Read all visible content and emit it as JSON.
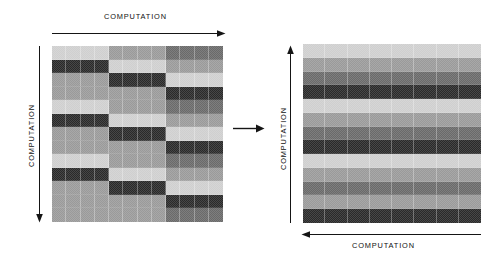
{
  "figure": {
    "title": "",
    "background_color": "#ffffff"
  },
  "labels": {
    "top_left": "COMPUTATION",
    "side_left": "COMPUTATION",
    "side_right": "COMPUTATION",
    "bottom_right": "COMPUTATION"
  },
  "arrows": {
    "top_left": {
      "name": "arrow-right",
      "direction": "right"
    },
    "side_left": {
      "name": "arrow-down",
      "direction": "down"
    },
    "middle": {
      "name": "arrow-right",
      "direction": "right"
    },
    "side_right": {
      "name": "arrow-up",
      "direction": "up"
    },
    "bottom_right": {
      "name": "arrow-left",
      "direction": "left"
    }
  },
  "chart_data": {
    "type": "heatmap",
    "title": "",
    "xlabel": "COMPUTATION",
    "ylabel": "COMPUTATION",
    "colormap": "grayscale",
    "value_range": [
      0,
      3
    ],
    "legend": [],
    "grid": true,
    "panels": [
      {
        "name": "left-matrix",
        "rows": 13,
        "cols": 12,
        "column_groups": 3,
        "columns_per_group": 4,
        "description": "Unbalanced / scattered block assignment before redistribution",
        "shade_levels": {
          "0": "#cfcfcf",
          "1": "#9a9a9a",
          "2": "#6a6a6a",
          "3": "#2a2a2a"
        },
        "values": [
          [
            0,
            0,
            0,
            0,
            1,
            1,
            1,
            1,
            2,
            2,
            2,
            2
          ],
          [
            3,
            3,
            3,
            3,
            0,
            0,
            0,
            0,
            1,
            1,
            1,
            1
          ],
          [
            1,
            1,
            1,
            1,
            3,
            3,
            3,
            3,
            0,
            0,
            0,
            0
          ],
          [
            1,
            1,
            1,
            1,
            1,
            1,
            1,
            1,
            3,
            3,
            3,
            3
          ],
          [
            0,
            0,
            0,
            0,
            1,
            1,
            1,
            1,
            2,
            2,
            2,
            2
          ],
          [
            3,
            3,
            3,
            3,
            0,
            0,
            0,
            0,
            1,
            1,
            1,
            1
          ],
          [
            1,
            1,
            1,
            1,
            3,
            3,
            3,
            3,
            0,
            0,
            0,
            0
          ],
          [
            1,
            1,
            1,
            1,
            1,
            1,
            1,
            1,
            3,
            3,
            3,
            3
          ],
          [
            0,
            0,
            0,
            0,
            1,
            1,
            1,
            1,
            2,
            2,
            2,
            2
          ],
          [
            3,
            3,
            3,
            3,
            0,
            0,
            0,
            0,
            1,
            1,
            1,
            1
          ],
          [
            1,
            1,
            1,
            1,
            3,
            3,
            3,
            3,
            0,
            0,
            0,
            0
          ],
          [
            1,
            1,
            1,
            1,
            1,
            1,
            1,
            1,
            3,
            3,
            3,
            3
          ],
          [
            1,
            1,
            1,
            1,
            1,
            1,
            1,
            1,
            2,
            2,
            2,
            2
          ]
        ]
      },
      {
        "name": "right-matrix",
        "rows": 13,
        "cols": 8,
        "column_groups": 8,
        "columns_per_group": 1,
        "description": "Balanced / striped assignment after redistribution — each row uniform across all columns",
        "shade_levels": {
          "0": "#cfcfcf",
          "1": "#9a9a9a",
          "2": "#6a6a6a",
          "3": "#2a2a2a"
        },
        "values": [
          [
            0,
            0,
            0,
            0,
            0,
            0,
            0,
            0
          ],
          [
            1,
            1,
            1,
            1,
            1,
            1,
            1,
            1
          ],
          [
            2,
            2,
            2,
            2,
            2,
            2,
            2,
            2
          ],
          [
            3,
            3,
            3,
            3,
            3,
            3,
            3,
            3
          ],
          [
            0,
            0,
            0,
            0,
            0,
            0,
            0,
            0
          ],
          [
            1,
            1,
            1,
            1,
            1,
            1,
            1,
            1
          ],
          [
            2,
            2,
            2,
            2,
            2,
            2,
            2,
            2
          ],
          [
            3,
            3,
            3,
            3,
            3,
            3,
            3,
            3
          ],
          [
            0,
            0,
            0,
            0,
            0,
            0,
            0,
            0
          ],
          [
            1,
            1,
            1,
            1,
            1,
            1,
            1,
            1
          ],
          [
            2,
            2,
            2,
            2,
            2,
            2,
            2,
            2
          ],
          [
            1,
            1,
            1,
            1,
            1,
            1,
            1,
            1
          ],
          [
            3,
            3,
            3,
            3,
            3,
            3,
            3,
            3
          ]
        ]
      }
    ]
  }
}
